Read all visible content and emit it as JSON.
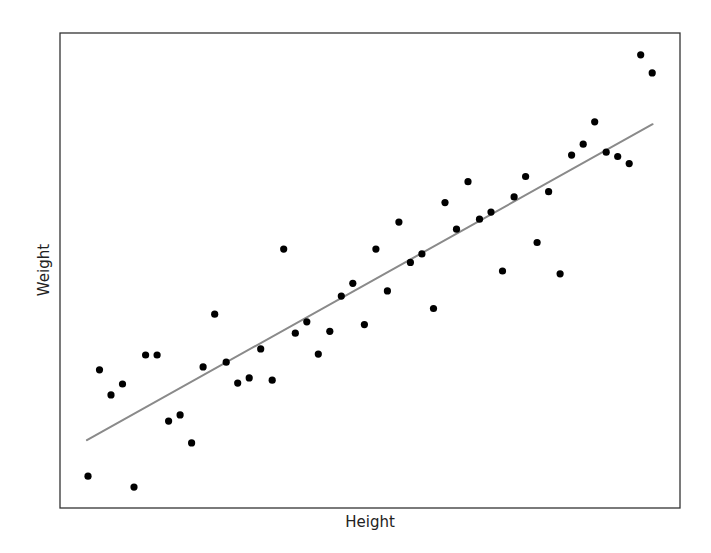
{
  "chart_data": {
    "type": "scatter",
    "title": "",
    "xlabel": "Height",
    "ylabel": "Weight",
    "x_ticks_visible": false,
    "y_ticks_visible": false,
    "grid": false,
    "legend": null,
    "xlim": [
      -2.43,
      51.41
    ],
    "ylim": [
      0,
      100
    ],
    "series": [
      {
        "name": "observations",
        "kind": "scatter",
        "color": "#000000",
        "marker_radius": 3.6,
        "x": [
          0,
          1,
          2,
          3,
          4,
          5,
          6,
          7,
          8,
          9,
          10,
          11,
          12,
          13,
          14,
          15,
          16,
          17,
          18,
          19,
          20,
          21,
          22,
          23,
          24,
          25,
          26,
          27,
          28,
          29,
          30,
          31,
          32,
          33,
          34,
          35,
          36,
          37,
          38,
          39,
          40,
          41,
          42,
          43,
          44,
          45,
          46,
          47,
          48,
          49
        ],
        "y": [
          6.7,
          29.1,
          23.8,
          26.1,
          4.4,
          32.2,
          32.2,
          18.3,
          19.6,
          13.7,
          29.7,
          40.8,
          30.7,
          26.3,
          27.4,
          33.5,
          26.9,
          54.5,
          36.8,
          39.2,
          32.4,
          37.2,
          44.6,
          47.3,
          38.6,
          54.5,
          45.7,
          60.2,
          51.7,
          53.5,
          42.0,
          64.3,
          58.7,
          68.7,
          60.8,
          62.3,
          49.9,
          65.5,
          69.8,
          55.9,
          66.6,
          49.3,
          74.3,
          76.6,
          81.3,
          74.9,
          74.0,
          72.5,
          95.4,
          91.6
        ]
      },
      {
        "name": "linear-fit",
        "kind": "line",
        "color": "#8a8a8a",
        "line_width": 2,
        "x": [
          -0.09,
          49.03
        ],
        "y": [
          14.3,
          80.8
        ]
      }
    ]
  },
  "plot": {
    "frame_color": "#333333",
    "background": "#ffffff"
  },
  "labels": {
    "x_axis": "Height",
    "y_axis": "Weight"
  }
}
